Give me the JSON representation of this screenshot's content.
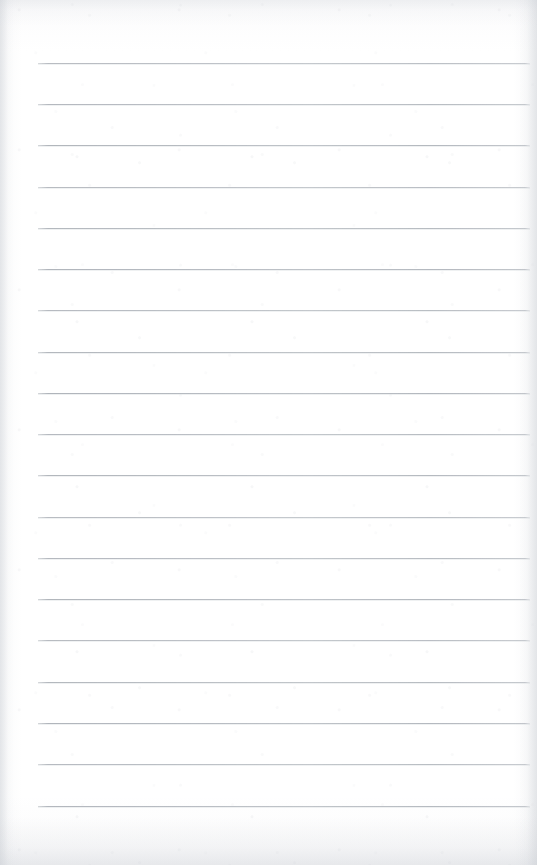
{
  "page": {
    "kind": "blank-lined-notebook-page",
    "width_px": 537,
    "height_px": 865,
    "paper_color": "#ffffff",
    "background_tint": "#fbfbfc",
    "edge_shadow_color": "#c6cad0"
  },
  "ruling": {
    "line_color": "#acb1b8",
    "line_thickness_px": 1,
    "line_count": 19,
    "first_line_y": 63,
    "line_spacing_px": 41.3,
    "line_left_x": 38,
    "line_right_x": 530,
    "line_length_px": 492,
    "has_margin_rule": false,
    "has_header_rule": false,
    "lines_y": [
      63,
      104,
      145,
      187,
      228,
      269,
      310,
      352,
      393,
      434,
      475,
      517,
      558,
      599,
      640,
      682,
      723,
      764,
      806
    ]
  },
  "content": {
    "text": "",
    "note": "no visible writing, headings, page numbers or marks on the sheet"
  }
}
